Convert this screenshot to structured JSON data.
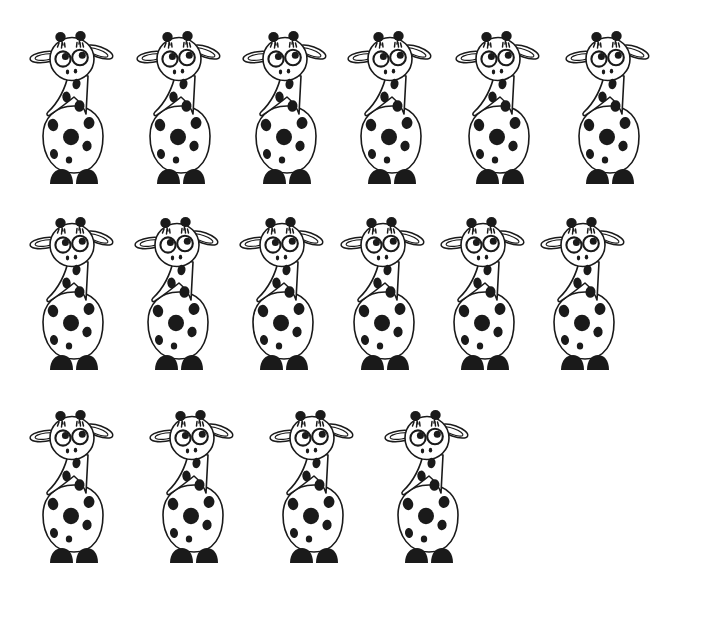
{
  "page": {
    "background_color": "#ffffff",
    "ink_color": "#1a1a1a",
    "width": 702,
    "height": 621,
    "total_count": 16,
    "row_counts": [
      6,
      6,
      4
    ]
  },
  "figure": {
    "name": "giraffe",
    "style": "black-and-white line drawing",
    "parts": [
      "left-ossicone",
      "right-ossicone",
      "left-ear",
      "right-ear",
      "head",
      "left-eye",
      "right-eye",
      "nostrils",
      "neck",
      "body",
      "spots",
      "left-hoof",
      "right-hoof"
    ]
  },
  "rows": [
    {
      "index": 1,
      "count": 6,
      "top": 26,
      "items": [
        {
          "label": "giraffe-1",
          "left": 26
        },
        {
          "label": "giraffe-2",
          "left": 133
        },
        {
          "label": "giraffe-3",
          "left": 239
        },
        {
          "label": "giraffe-4",
          "left": 344
        },
        {
          "label": "giraffe-5",
          "left": 452
        },
        {
          "label": "giraffe-6",
          "left": 562
        }
      ]
    },
    {
      "index": 2,
      "count": 6,
      "top": 212,
      "items": [
        {
          "label": "giraffe-7",
          "left": 26
        },
        {
          "label": "giraffe-8",
          "left": 131
        },
        {
          "label": "giraffe-9",
          "left": 236
        },
        {
          "label": "giraffe-10",
          "left": 337
        },
        {
          "label": "giraffe-11",
          "left": 437
        },
        {
          "label": "giraffe-12",
          "left": 537
        }
      ]
    },
    {
      "index": 3,
      "count": 4,
      "top": 405,
      "items": [
        {
          "label": "giraffe-13",
          "left": 26
        },
        {
          "label": "giraffe-14",
          "left": 146
        },
        {
          "label": "giraffe-15",
          "left": 266
        },
        {
          "label": "giraffe-16",
          "left": 381
        }
      ]
    }
  ]
}
